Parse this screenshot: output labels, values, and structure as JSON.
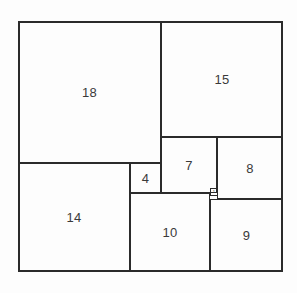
{
  "diagram": {
    "kind": "squared-square-dissection",
    "outer": {
      "label": "32",
      "x": 18,
      "y": 21,
      "width": 265,
      "height": 251
    },
    "stroke_color": "#2b2b2b",
    "text_color": "#3a3a3a",
    "background_color": "#fdfdfd",
    "squares": [
      {
        "label": "18",
        "x": 18,
        "y": 21,
        "width": 143,
        "height": 142,
        "tiny": false
      },
      {
        "label": "15",
        "x": 161,
        "y": 21,
        "width": 122,
        "height": 116,
        "tiny": false
      },
      {
        "label": "14",
        "x": 18,
        "y": 163,
        "width": 112,
        "height": 109,
        "tiny": false
      },
      {
        "label": "10",
        "x": 130,
        "y": 193,
        "width": 80,
        "height": 79,
        "tiny": false
      },
      {
        "label": "9",
        "x": 210,
        "y": 199,
        "width": 73,
        "height": 73,
        "tiny": false
      },
      {
        "label": "8",
        "x": 217,
        "y": 137,
        "width": 66,
        "height": 62,
        "tiny": false
      },
      {
        "label": "7",
        "x": 161,
        "y": 137,
        "width": 56,
        "height": 56,
        "tiny": false
      },
      {
        "label": "4",
        "x": 130,
        "y": 163,
        "width": 31,
        "height": 30,
        "tiny": false
      },
      {
        "label": "1",
        "x": 210,
        "y": 188,
        "width": 8,
        "height": 8,
        "tiny": true
      }
    ]
  }
}
